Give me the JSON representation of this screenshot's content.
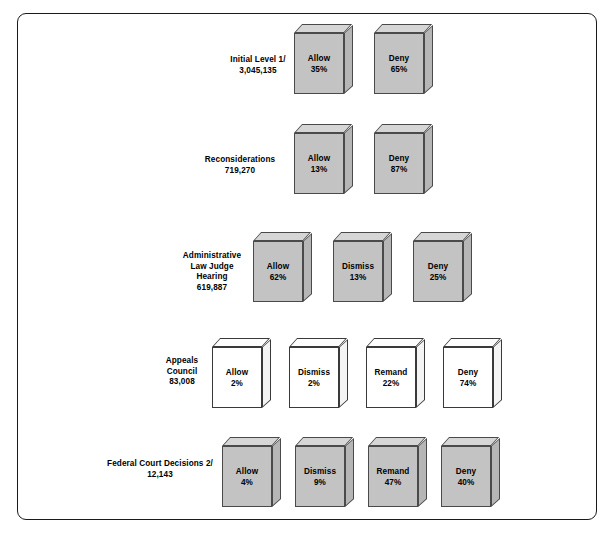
{
  "figure": {
    "title": "",
    "background": "#ffffff",
    "frame_color": "#1a1a1a"
  },
  "colors": {
    "box_face_gray": "#c3c3c3",
    "box_top_gray": "#d6d6d6",
    "box_side_gray": "#b6b6b6",
    "box_face_white": "#ffffff",
    "outline": "#4a4a4a",
    "text": "#000000"
  },
  "chart_data": {
    "type": "table",
    "title": "",
    "xlabel": "",
    "ylabel": "",
    "units": "percent",
    "legend": [],
    "grid": false,
    "stages": [
      {
        "name": "Initial Level 1/",
        "label_lines": [
          "Initial Level 1/",
          "3,045,135"
        ],
        "count": "3,045,135",
        "style": "gray",
        "outcomes": [
          {
            "label": "Allow",
            "value": "35%",
            "pct": 35
          },
          {
            "label": "Deny",
            "value": "65%",
            "pct": 65
          }
        ]
      },
      {
        "name": "Reconsiderations",
        "label_lines": [
          "Reconsiderations",
          "719,270"
        ],
        "count": "719,270",
        "style": "gray",
        "outcomes": [
          {
            "label": "Allow",
            "value": "13%",
            "pct": 13
          },
          {
            "label": "Deny",
            "value": "87%",
            "pct": 87
          }
        ]
      },
      {
        "name": "Administrative Law Judge Hearing",
        "label_lines": [
          "Administrative",
          "Law Judge",
          "Hearing",
          "619,887"
        ],
        "count": "619,887",
        "style": "gray",
        "outcomes": [
          {
            "label": "Allow",
            "value": "62%",
            "pct": 62
          },
          {
            "label": "Dismiss",
            "value": "13%",
            "pct": 13
          },
          {
            "label": "Deny",
            "value": "25%",
            "pct": 25
          }
        ]
      },
      {
        "name": "Appeals Council",
        "label_lines": [
          "Appeals",
          "Council",
          "83,008"
        ],
        "count": "83,008",
        "style": "white",
        "outcomes": [
          {
            "label": "Allow",
            "value": "2%",
            "pct": 2
          },
          {
            "label": "Dismiss",
            "value": "2%",
            "pct": 2
          },
          {
            "label": "Remand",
            "value": "22%",
            "pct": 22
          },
          {
            "label": "Deny",
            "value": "74%",
            "pct": 74
          }
        ]
      },
      {
        "name": "Federal Court Decisions 2/",
        "label_lines": [
          "Federal Court Decisions 2/",
          "12,143"
        ],
        "count": "12,143",
        "style": "gray",
        "outcomes": [
          {
            "label": "Allow",
            "value": "4%",
            "pct": 4
          },
          {
            "label": "Dismiss",
            "value": "9%",
            "pct": 9
          },
          {
            "label": "Remand",
            "value": "47%",
            "pct": 47
          },
          {
            "label": "Deny",
            "value": "40%",
            "pct": 40
          }
        ]
      }
    ]
  },
  "layout": {
    "rows": [
      {
        "label_center_x": 258,
        "label_center_y": 66,
        "box_y": 24,
        "box_xs": [
          294,
          374
        ]
      },
      {
        "label_center_x": 240,
        "label_center_y": 166,
        "box_y": 124,
        "box_xs": [
          294,
          374
        ]
      },
      {
        "label_center_x": 212,
        "label_center_y": 272,
        "box_y": 232,
        "box_xs": [
          253,
          333,
          413
        ]
      },
      {
        "label_center_x": 182,
        "label_center_y": 372,
        "box_y": 338,
        "box_xs": [
          212,
          289,
          366,
          443
        ]
      },
      {
        "label_center_x": 160,
        "label_center_y": 470,
        "box_y": 437,
        "box_xs": [
          222,
          295,
          368,
          441
        ]
      }
    ]
  }
}
